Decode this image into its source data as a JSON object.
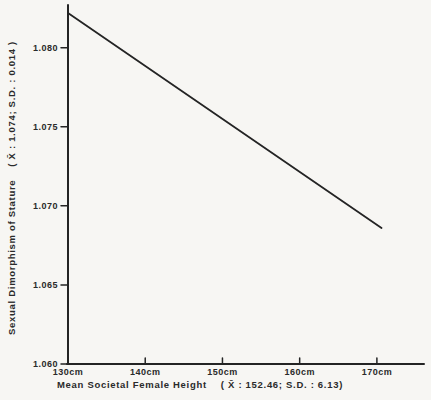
{
  "colors": {
    "ink": "#242424",
    "text": "#2a2a2a",
    "background": "#f7f6f3"
  },
  "chart_data": {
    "type": "line",
    "title": "",
    "xlabel": "Mean Societal Female Height",
    "xlabel_stats": "( X̄ : 152.46;  S.D. : 6.13)",
    "ylabel": "Sexual Dimorphism of Stature",
    "ylabel_stats": "( X̄ : 1.074;  S.D. : 0.014 )",
    "xlim": [
      130,
      176.1
    ],
    "ylim": [
      1.06,
      1.0827
    ],
    "grid": false,
    "legend": false,
    "x_ticks": [
      {
        "value": 130,
        "label": "130cm"
      },
      {
        "value": 140,
        "label": "140cm"
      },
      {
        "value": 150,
        "label": "150cm"
      },
      {
        "value": 160,
        "label": "160cm"
      },
      {
        "value": 170,
        "label": "170cm"
      }
    ],
    "y_ticks": [
      {
        "value": 1.08,
        "label": "1.080"
      },
      {
        "value": 1.075,
        "label": "1.075"
      },
      {
        "value": 1.07,
        "label": "1.070"
      },
      {
        "value": 1.065,
        "label": "1.065"
      },
      {
        "value": 1.06,
        "label": "1.060"
      }
    ],
    "series": [
      {
        "name": "regression-line",
        "points": [
          {
            "x": 130.0,
            "y": 1.0822
          },
          {
            "x": 170.6,
            "y": 1.0686
          }
        ]
      }
    ]
  }
}
